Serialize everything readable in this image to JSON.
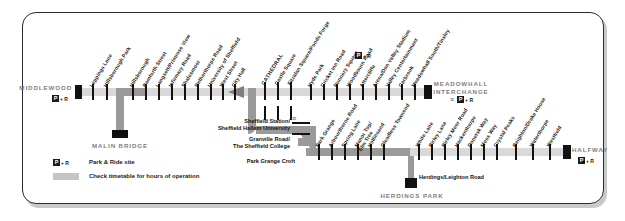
{
  "map": {
    "title": "Sheffield Supertram network map",
    "colors": {
      "line_light": "#d9d9d9",
      "line_dark": "#9a9a9a",
      "stop_mark": "#111111",
      "terminus_text": "#808080",
      "frame": "#2b2b2b"
    },
    "termini": [
      {
        "name": "MIDDLEWOOD",
        "park_and_ride": true
      },
      {
        "name": "MALIN BRIDGE",
        "park_and_ride": false
      },
      {
        "name": "MEADOWHALL INTERCHANGE",
        "park_and_ride": true,
        "rail": true
      },
      {
        "name": "HALFWAY",
        "park_and_ride": true
      },
      {
        "name": "HERDINGS PARK",
        "park_and_ride": false
      }
    ],
    "branches": {
      "middlewood": [
        "Leppings Lane",
        "Hillsborough Park",
        "Hillsborough",
        "Bamforth Street",
        "Langsett/Primrose View",
        "Infirmary Road",
        "Shalesmoor",
        "Netherthorpe Road",
        "University of Sheffield",
        "West Street",
        "City Hall"
      ],
      "city_to_meadowhall": [
        "CATHEDRAL",
        "Castle Square",
        "Fitzalan Square/Ponds Forge",
        "Hyde Park",
        "Cricket Inn Road",
        "Nunnery Square",
        "Woodbourn Road",
        "Attercliffe",
        "Arena/Don Valley Stadium",
        "Valley Centertainment",
        "Carbrook",
        "Meadowhall South/Tinsley"
      ],
      "city_centre_block": [
        "Sheffield Station/",
        "Sheffield Hallam University",
        "Granville Road/",
        "The Sheffield College",
        "Park Grange Croft"
      ],
      "halfway": [
        "Park Grange",
        "Arbourthorne Road",
        "Spring Lane",
        "Manor Top/",
        "Elm Tree",
        "Hollinsend",
        "Gleadless Townend",
        "White Lane",
        "Birley Lane",
        "Birley Moor Road",
        "Hackenthorpe",
        "Donetsk Way",
        "Moss Way",
        "Crystal Peaks",
        "Beighton/Drake House",
        "Waterthorpe",
        "Westfield"
      ],
      "herdings": [
        "Herdings/Leighton Road"
      ]
    },
    "legend": {
      "park_ride_label": "Park & Ride site",
      "park_ride_icon": "P + R",
      "timetable_label": "Check timetable for hours of operation"
    },
    "icons": {
      "p_box": "P",
      "plus_r": "+ R",
      "rail": "☰"
    }
  }
}
